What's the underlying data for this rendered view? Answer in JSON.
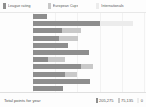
{
  "legend": {
    "items": [
      {
        "label": "League rating",
        "color": "#8e8e8e",
        "icon": "square-swatch-icon"
      },
      {
        "label": "European Cups",
        "color": "#c9c9c9",
        "icon": "square-swatch-icon"
      },
      {
        "label": "Internationals",
        "color": "#ececec",
        "icon": "square-swatch-icon"
      }
    ]
  },
  "footer": {
    "label": "Total points for year",
    "totals": [
      {
        "series": "League rating",
        "value": "205,275",
        "color": "#8e8e8e"
      },
      {
        "series": "European Cups",
        "value": "75,135",
        "color": "#c9c9c9"
      },
      {
        "series": "Internationals",
        "value": "0",
        "color": "#ececec"
      }
    ]
  },
  "chart_data": {
    "type": "bar",
    "orientation": "horizontal",
    "stacked": true,
    "title": "",
    "xlabel": "",
    "ylabel": "",
    "grid": true,
    "legend_position": "top",
    "categories": [
      "1",
      "2",
      "3",
      "4",
      "5",
      "6",
      "7",
      "8",
      "9",
      "10",
      "11"
    ],
    "series": [
      {
        "name": "League rating",
        "color": "#8e8e8e",
        "values": [
          14,
          67,
          29,
          26,
          35,
          56,
          15,
          48,
          32,
          57,
          30
        ]
      },
      {
        "name": "European Cups",
        "color": "#c9c9c9",
        "values": [
          0,
          0,
          19,
          19,
          0,
          0,
          17,
          12,
          12,
          0,
          0
        ]
      },
      {
        "name": "Internationals",
        "color": "#ececec",
        "values": [
          0,
          33,
          0,
          0,
          0,
          0,
          0,
          0,
          0,
          0,
          0
        ]
      }
    ],
    "xlim": [
      0,
      111
    ],
    "gridline_positions": [
      0,
      22,
      44,
      67,
      89,
      111
    ]
  }
}
